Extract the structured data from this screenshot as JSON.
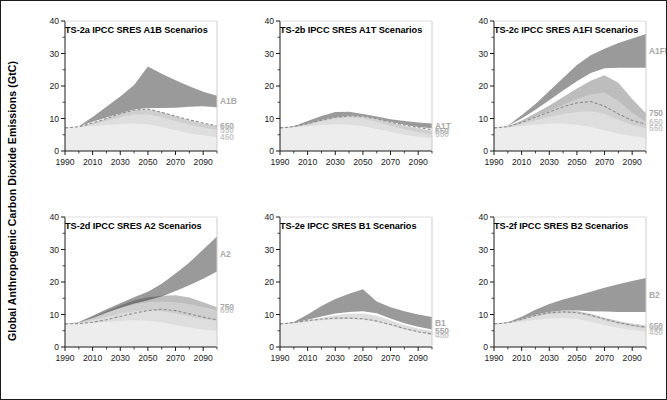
{
  "figure": {
    "ylabel": "Global Anthropogenic Carbon Dioxide Emissions (GtC)",
    "border_color": "#1b1b1b",
    "background": "#ffffff"
  },
  "colors": {
    "sres_band": "#9a9a9a",
    "sres_band_dark": "#6e6e6e",
    "stab_750": "#bdbdbd",
    "stab_650": "#cfcfcf",
    "stab_550": "#dedede",
    "stab_450": "#ededed",
    "reference_line": "#8c8c8c",
    "axis": "#1b1b1b",
    "label_faint": "#c9c9c9",
    "label_mid": "#a8a8a8"
  },
  "axes": {
    "y_ticks": [
      0,
      10,
      20,
      30,
      40
    ],
    "y_minor_ticks": [
      5,
      15,
      25,
      35
    ],
    "y_min": 0,
    "y_max": 40,
    "x_ticks": [
      1990,
      2010,
      2030,
      2050,
      2070,
      2090
    ],
    "x_min": 1990,
    "x_max": 2100,
    "y_unit": "GtC"
  },
  "chart_data": {
    "type": "area",
    "xlabel": "",
    "ylabel": "Global Anthropogenic Carbon Dioxide Emissions (GtC)",
    "xlim": [
      1990,
      2100
    ],
    "ylim": [
      0,
      40
    ],
    "grid": false,
    "legend": "inline-right-edge",
    "x": [
      1990,
      2000,
      2010,
      2020,
      2030,
      2040,
      2050,
      2060,
      2070,
      2080,
      2090,
      2100
    ],
    "panels": [
      {
        "id": "TS-2a",
        "title": "TS-2a IPCC SRES A1B Scenarios",
        "scenario": "A1B",
        "edge_labels": [
          "A1B",
          "650",
          "550",
          "450"
        ],
        "series": [
          {
            "name": "A1B upper",
            "values": [
              7.1,
              7.6,
              10.5,
              13.6,
              16.8,
              20.3,
              26.0,
              23.8,
              21.8,
              19.9,
              18.2,
              17.0
            ]
          },
          {
            "name": "A1B lower",
            "values": [
              7.1,
              7.6,
              9.0,
              10.3,
              11.6,
              12.8,
              13.2,
              13.2,
              13.3,
              13.6,
              13.8,
              13.5
            ]
          },
          {
            "name": "stab 650",
            "values": [
              7.1,
              7.5,
              8.6,
              10.0,
              11.6,
              12.6,
              12.8,
              11.9,
              10.7,
              9.5,
              8.5,
              7.6
            ]
          },
          {
            "name": "stab 550",
            "values": [
              7.1,
              7.4,
              8.2,
              9.3,
              10.4,
              11.2,
              11.4,
              10.4,
              9.2,
              8.1,
              7.2,
              6.5
            ]
          },
          {
            "name": "stab 450",
            "values": [
              7.1,
              7.3,
              7.6,
              8.0,
              8.3,
              8.4,
              8.2,
              7.4,
              6.4,
              5.5,
              4.8,
              4.3
            ]
          },
          {
            "name": "reference",
            "values": [
              7.1,
              7.5,
              8.6,
              10.0,
              11.5,
              12.6,
              12.9,
              11.9,
              10.7,
              9.6,
              8.6,
              7.7
            ]
          }
        ]
      },
      {
        "id": "TS-2b",
        "title": "TS-2b IPCC SRES A1T Scenarios",
        "scenario": "A1T",
        "edge_labels": [
          "A1T",
          "650",
          "550"
        ],
        "series": [
          {
            "name": "A1T upper",
            "values": [
              7.1,
              7.6,
              9.2,
              10.8,
              12.0,
              12.1,
              11.4,
              10.6,
              9.8,
              9.2,
              8.8,
              8.5
            ]
          },
          {
            "name": "A1T lower",
            "values": [
              7.1,
              7.5,
              8.4,
              9.6,
              10.5,
              10.9,
              10.8,
              10.0,
              9.0,
              8.1,
              7.4,
              7.0
            ]
          },
          {
            "name": "stab 650",
            "values": [
              7.1,
              7.5,
              8.5,
              9.8,
              11.0,
              11.3,
              10.9,
              10.0,
              8.9,
              7.8,
              6.9,
              6.2
            ]
          },
          {
            "name": "stab 550",
            "values": [
              7.1,
              7.4,
              8.1,
              9.1,
              10.0,
              10.3,
              10.0,
              9.0,
              7.8,
              6.7,
              5.8,
              5.1
            ]
          },
          {
            "name": "stab 450",
            "values": [
              7.1,
              7.3,
              7.6,
              8.0,
              8.2,
              8.1,
              7.7,
              6.8,
              5.9,
              5.0,
              4.4,
              4.0
            ]
          },
          {
            "name": "reference",
            "values": [
              7.1,
              7.5,
              8.4,
              9.5,
              10.4,
              10.8,
              10.7,
              9.9,
              8.9,
              8.0,
              7.2,
              6.6
            ]
          }
        ]
      },
      {
        "id": "TS-2c",
        "title": "TS-2c IPCC SRES A1FI Scenarios",
        "scenario": "A1FI",
        "edge_labels": [
          "A1FI",
          "750",
          "650",
          "550"
        ],
        "series": [
          {
            "name": "A1FI upper",
            "values": [
              7.1,
              7.8,
              11.0,
              14.5,
              18.5,
              22.5,
              26.5,
              29.5,
              31.5,
              33.2,
              34.6,
              36.0
            ]
          },
          {
            "name": "A1FI lower",
            "values": [
              7.1,
              7.7,
              10.0,
              12.7,
              15.6,
              18.6,
              21.5,
              24.0,
              25.5,
              25.6,
              25.6,
              25.6
            ]
          },
          {
            "name": "stab 750",
            "values": [
              7.1,
              7.6,
              9.4,
              11.6,
              14.0,
              16.6,
              19.2,
              21.6,
              23.3,
              21.0,
              16.0,
              11.6
            ]
          },
          {
            "name": "stab 650",
            "values": [
              7.1,
              7.5,
              8.9,
              10.6,
              12.4,
              14.2,
              16.0,
              17.5,
              18.0,
              15.5,
              11.8,
              9.0
            ]
          },
          {
            "name": "stab 550",
            "values": [
              7.1,
              7.4,
              8.3,
              9.4,
              10.5,
              11.4,
              12.0,
              12.2,
              11.4,
              9.6,
              8.0,
              7.0
            ]
          },
          {
            "name": "stab 450",
            "values": [
              7.1,
              7.3,
              7.7,
              8.1,
              8.4,
              8.4,
              8.1,
              7.4,
              6.4,
              5.4,
              4.6,
              4.1
            ]
          },
          {
            "name": "reference",
            "values": [
              7.1,
              7.5,
              8.8,
              10.4,
              12.0,
              13.6,
              14.8,
              15.2,
              13.8,
              11.4,
              9.4,
              8.2
            ]
          }
        ]
      },
      {
        "id": "TS-2d",
        "title": "TS-2d IPCC SRES A2 Scenarios",
        "scenario": "A2",
        "edge_labels": [
          "A2",
          "750",
          "650"
        ],
        "series": [
          {
            "name": "A2 upper",
            "values": [
              7.1,
              7.7,
              9.6,
              11.6,
              13.5,
              15.3,
              17.0,
              19.5,
              22.6,
              26.0,
              30.0,
              34.0
            ]
          },
          {
            "name": "A2 lower",
            "values": [
              7.1,
              7.6,
              9.0,
              10.6,
              12.1,
              13.4,
              14.4,
              15.6,
              17.2,
              19.0,
              21.0,
              23.2
            ]
          },
          {
            "name": "stab 750",
            "values": [
              7.1,
              7.6,
              9.2,
              11.0,
              12.8,
              14.3,
              15.3,
              15.8,
              15.9,
              15.2,
              13.8,
              12.2
            ]
          },
          {
            "name": "stab 650",
            "values": [
              7.1,
              7.5,
              8.8,
              10.4,
              11.9,
              13.1,
              13.8,
              14.0,
              13.8,
              13.2,
              12.3,
              11.4
            ]
          },
          {
            "name": "stab 550",
            "values": [
              7.1,
              7.4,
              8.2,
              9.2,
              10.2,
              11.0,
              11.3,
              11.0,
              10.3,
              9.4,
              8.6,
              8.0
            ]
          },
          {
            "name": "stab 450",
            "values": [
              7.1,
              7.2,
              7.4,
              7.7,
              8.0,
              8.2,
              8.1,
              7.6,
              6.8,
              6.0,
              5.4,
              5.0
            ]
          },
          {
            "name": "reference",
            "values": [
              7.1,
              7.2,
              7.6,
              8.4,
              9.4,
              10.4,
              11.2,
              11.6,
              11.2,
              10.2,
              9.2,
              8.4
            ]
          }
        ]
      },
      {
        "id": "TS-2e",
        "title": "TS-2e IPCC SRES B1 Scenarios",
        "scenario": "B1",
        "edge_labels": [
          "B1",
          "550",
          "450"
        ],
        "series": [
          {
            "name": "B1 upper",
            "values": [
              7.1,
              7.7,
              10.0,
              12.6,
              14.8,
              16.4,
              17.8,
              14.0,
              12.2,
              11.0,
              10.0,
              9.2
            ]
          },
          {
            "name": "B1 lower",
            "values": [
              7.1,
              7.5,
              8.4,
              9.4,
              10.3,
              10.8,
              11.0,
              10.4,
              8.8,
              7.3,
              6.2,
              5.4
            ]
          },
          {
            "name": "stab 550",
            "values": [
              7.1,
              7.5,
              8.2,
              9.0,
              9.8,
              10.2,
              10.3,
              9.6,
              8.2,
              6.8,
              5.7,
              4.9
            ]
          },
          {
            "name": "stab 450",
            "values": [
              7.1,
              7.4,
              7.8,
              8.2,
              8.5,
              8.6,
              8.4,
              7.7,
              6.6,
              5.4,
              4.4,
              3.6
            ]
          },
          {
            "name": "reference",
            "values": [
              7.1,
              7.5,
              8.1,
              8.6,
              8.9,
              8.9,
              8.7,
              8.0,
              6.9,
              5.7,
              4.7,
              4.0
            ]
          }
        ]
      },
      {
        "id": "TS-2f",
        "title": "TS-2f IPCC SRES B2 Scenarios",
        "scenario": "B2",
        "edge_labels": [
          "B2",
          "650",
          "550",
          "450"
        ],
        "series": [
          {
            "name": "B2 upper",
            "values": [
              7.1,
              7.6,
              9.3,
              11.5,
              13.2,
              14.6,
              15.8,
              17.0,
              18.2,
              19.3,
              20.3,
              21.2
            ]
          },
          {
            "name": "B2 lower",
            "values": [
              7.1,
              7.5,
              8.6,
              9.9,
              10.8,
              11.2,
              11.2,
              11.0,
              10.9,
              10.8,
              10.8,
              10.8
            ]
          },
          {
            "name": "stab 650",
            "values": [
              7.1,
              7.5,
              8.6,
              9.9,
              10.8,
              11.2,
              11.1,
              10.2,
              9.0,
              8.0,
              7.2,
              6.6
            ]
          },
          {
            "name": "stab 550",
            "values": [
              7.1,
              7.4,
              8.3,
              9.4,
              10.2,
              10.5,
              10.3,
              9.4,
              8.2,
              7.1,
              6.3,
              5.7
            ]
          },
          {
            "name": "stab 450",
            "values": [
              7.1,
              7.3,
              7.8,
              8.4,
              8.8,
              8.9,
              8.6,
              7.8,
              6.8,
              5.9,
              5.2,
              4.7
            ]
          },
          {
            "name": "reference",
            "values": [
              7.1,
              7.5,
              8.5,
              9.7,
              10.5,
              10.8,
              10.6,
              9.8,
              8.6,
              7.5,
              6.7,
              6.1
            ]
          }
        ]
      }
    ]
  }
}
